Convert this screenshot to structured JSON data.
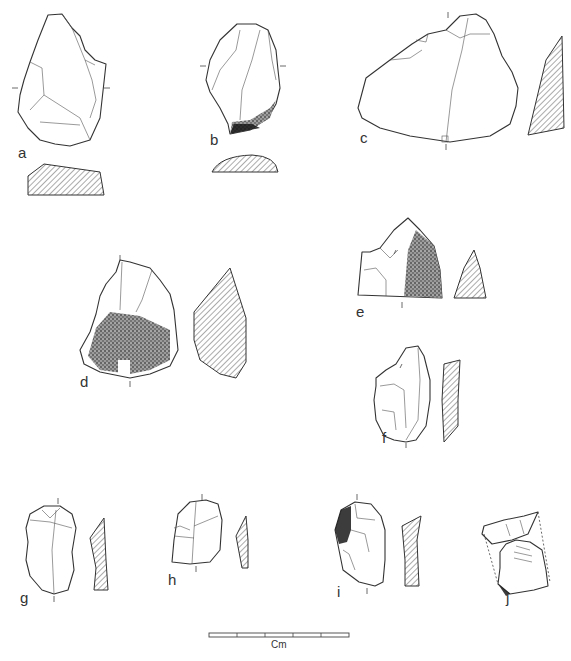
{
  "figure": {
    "type": "lithic-artifact-plate",
    "colors": {
      "line": "#333333",
      "background": "#ffffff",
      "cortex": "#1a1a1a"
    },
    "artifacts": [
      {
        "id": "a",
        "label": "a",
        "has_cross_section": true,
        "section_position": "below"
      },
      {
        "id": "b",
        "label": "b",
        "has_cross_section": true,
        "section_position": "below",
        "cortex": true
      },
      {
        "id": "c",
        "label": "c",
        "has_cross_section": true,
        "section_position": "right"
      },
      {
        "id": "d",
        "label": "d",
        "has_cross_section": true,
        "section_position": "right",
        "cortex": true
      },
      {
        "id": "e",
        "label": "e",
        "has_cross_section": true,
        "section_position": "right",
        "cortex": true
      },
      {
        "id": "f",
        "label": "f",
        "has_cross_section": true,
        "section_position": "right"
      },
      {
        "id": "g",
        "label": "g",
        "has_cross_section": true,
        "section_position": "right"
      },
      {
        "id": "h",
        "label": "h",
        "has_cross_section": true,
        "section_position": "right"
      },
      {
        "id": "i",
        "label": "i",
        "has_cross_section": true,
        "section_position": "right",
        "cortex": true
      },
      {
        "id": "j",
        "label": "j",
        "has_cross_section": false
      }
    ],
    "scale_bar": {
      "unit_label": "Cm",
      "divisions": 5
    }
  }
}
